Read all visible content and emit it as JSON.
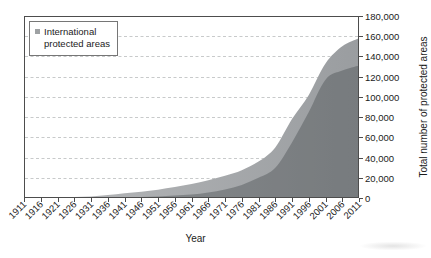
{
  "figure": {
    "legend": {
      "items": [
        {
          "label": "International protected areas",
          "swatch_color": "#9ea1a3"
        }
      ]
    },
    "x_axis": {
      "title": "Year",
      "ticks": [
        "1911",
        "1916",
        "1921",
        "1926",
        "1931",
        "1936",
        "1941",
        "1946",
        "1951",
        "1956",
        "1961",
        "1966",
        "1971",
        "1976",
        "1981",
        "1986",
        "1991",
        "1996",
        "2001",
        "2006",
        "2011"
      ]
    },
    "y_axis": {
      "title": "Total number of protected areas",
      "ticks": [
        "0",
        "20,000",
        "40,000",
        "60,000",
        "80,000",
        "100,000",
        "120,000",
        "140,000",
        "160,000",
        "180,000"
      ]
    }
  },
  "chart_data": {
    "type": "area",
    "x": [
      1911,
      1916,
      1921,
      1926,
      1931,
      1936,
      1941,
      1946,
      1951,
      1956,
      1961,
      1966,
      1971,
      1976,
      1981,
      1986,
      1991,
      1996,
      2001,
      2006,
      2011
    ],
    "series": [
      {
        "name": "All protected areas (outer area, unlabeled in legend)",
        "values": [
          200,
          400,
          700,
          1000,
          1600,
          3000,
          4600,
          6200,
          8200,
          10800,
          13800,
          17500,
          22000,
          27500,
          36000,
          50000,
          78000,
          102000,
          133000,
          150000,
          158000
        ],
        "fill_start": "#b7b9bb",
        "fill_end": "#9a9da0"
      },
      {
        "name": "International protected areas",
        "values": [
          0,
          0,
          0,
          100,
          200,
          400,
          700,
          1100,
          1600,
          2400,
          3500,
          5500,
          8500,
          13000,
          20000,
          30000,
          55000,
          85000,
          117000,
          126000,
          131000
        ],
        "fill": "rgba(55,59,63,0.35)"
      }
    ],
    "xlabel": "Year",
    "ylabel": "Total number of protected areas",
    "xlim": [
      1911,
      2011
    ],
    "ylim": [
      0,
      180000
    ],
    "ytick_step": 20000,
    "grid": "horizontal-dashed",
    "legend_position": "top-left",
    "legend_entries": [
      "International protected areas"
    ]
  },
  "style": {
    "grid_color": "#c8cacb",
    "frame_color": "#4d4d4d",
    "text_color": "#1b1b1b",
    "background": "#ffffff"
  }
}
